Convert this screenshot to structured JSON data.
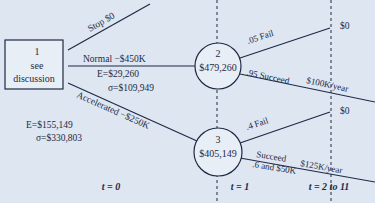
{
  "decision_node": {
    "number": "1",
    "line1": "see",
    "line2": "discussion"
  },
  "branches": {
    "stop": "Stop $0",
    "normal": "Normal −$450K",
    "normal_E": "E=$29,260",
    "normal_sigma": "σ=$109,949",
    "accelerated": "Accelerated −$250K",
    "accel_E": "E=$155,149",
    "accel_sigma": "σ=$330,803"
  },
  "chance_nodes": [
    {
      "number": "2",
      "value": "$479,260",
      "fail_label": ".05 Fail",
      "fail_payoff": "$0",
      "succeed_label": ".95 Succeed",
      "succeed_payoff": "$100K/year"
    },
    {
      "number": "3",
      "value": "$405,149",
      "fail_label": ".4 Fail",
      "fail_payoff": "$0",
      "succeed_label": "Succeed",
      "succeed_sublabel": ".6 and $50K",
      "succeed_payoff": "$125K/year"
    }
  ],
  "time_labels": [
    "t = 0",
    "t = 1",
    "t = 2 to 11"
  ],
  "colors": {
    "background": "#dde6f1",
    "ink": "#1f2a44",
    "node_fill": "#e8eef6"
  }
}
